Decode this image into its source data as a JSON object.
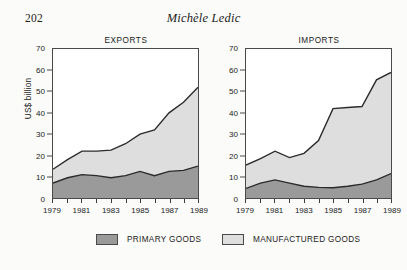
{
  "page": {
    "folio": "202",
    "running_head": "Michèle Ledic"
  },
  "legend": {
    "items": [
      {
        "label": "PRIMARY GOODS",
        "color": "#9a9a9a"
      },
      {
        "label": "MANUFACTURED GOODS",
        "color": "#dedede"
      }
    ]
  },
  "axes": {
    "ylabel": "US$ billion",
    "yticks": [
      0,
      10,
      20,
      30,
      40,
      50,
      60,
      70
    ],
    "xticks_labeled": [
      "1979",
      "1981",
      "1983",
      "1985",
      "1987",
      "1989"
    ],
    "xticks_all": [
      "1979",
      "1980",
      "1981",
      "1982",
      "1983",
      "1984",
      "1985",
      "1986",
      "1987",
      "1988",
      "1989"
    ]
  },
  "colors": {
    "primary_goods": "#9a9a9a",
    "manufactured_goods": "#dedede",
    "axis": "#4a4a4a",
    "line": "#2b2b2b",
    "page_background": "#fbfbf9"
  },
  "chart_data": [
    {
      "type": "area",
      "title": "EXPORTS",
      "stacked": true,
      "xlabel": "",
      "ylabel": "US$ billion",
      "ylim": [
        0,
        70
      ],
      "xlim": [
        1979,
        1989
      ],
      "grid": false,
      "legend_position": "bottom",
      "x": [
        1979,
        1980,
        1981,
        1982,
        1983,
        1984,
        1985,
        1986,
        1987,
        1988,
        1989
      ],
      "categories": [
        "1979",
        "1980",
        "1981",
        "1982",
        "1983",
        "1984",
        "1985",
        "1986",
        "1987",
        "1988",
        "1989"
      ],
      "series": [
        {
          "name": "PRIMARY GOODS",
          "values": [
            7.0,
            9.5,
            11.0,
            10.5,
            9.5,
            10.5,
            12.5,
            10.5,
            12.5,
            13.0,
            15.0
          ]
        },
        {
          "name": "MANUFACTURED GOODS",
          "values": [
            6.5,
            8.5,
            11.0,
            11.5,
            13.0,
            15.0,
            17.5,
            21.5,
            27.5,
            32.0,
            37.0
          ]
        }
      ],
      "totals": [
        13.5,
        18.0,
        22.0,
        22.0,
        22.5,
        25.5,
        30.0,
        32.0,
        40.0,
        45.0,
        52.0
      ]
    },
    {
      "type": "area",
      "title": "IMPORTS",
      "stacked": true,
      "xlabel": "",
      "ylabel": "US$ billion",
      "ylim": [
        0,
        70
      ],
      "xlim": [
        1979,
        1989
      ],
      "grid": false,
      "legend_position": "bottom",
      "x": [
        1979,
        1980,
        1981,
        1982,
        1983,
        1984,
        1985,
        1986,
        1987,
        1988,
        1989
      ],
      "categories": [
        "1979",
        "1980",
        "1981",
        "1982",
        "1983",
        "1984",
        "1985",
        "1986",
        "1987",
        "1988",
        "1989"
      ],
      "series": [
        {
          "name": "PRIMARY GOODS",
          "values": [
            4.5,
            7.0,
            8.5,
            7.0,
            5.5,
            5.0,
            4.8,
            5.5,
            6.5,
            8.5,
            11.5
          ]
        },
        {
          "name": "MANUFACTURED GOODS",
          "values": [
            11.0,
            11.5,
            13.5,
            12.0,
            15.5,
            22.0,
            37.2,
            37.0,
            36.5,
            47.0,
            47.5
          ]
        }
      ],
      "totals": [
        15.5,
        18.5,
        22.0,
        19.0,
        21.0,
        27.0,
        42.0,
        42.5,
        43.0,
        55.5,
        59.0
      ]
    }
  ]
}
